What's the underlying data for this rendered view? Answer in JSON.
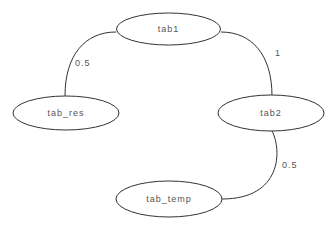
{
  "diagram": {
    "type": "graph",
    "background": "#ffffff",
    "stroke_color": "#333333",
    "text_color": "#555555",
    "nodes": [
      {
        "id": "tab1",
        "label": "tab1",
        "cx": 168.5,
        "cy": 29,
        "rx": 52,
        "ry": 16
      },
      {
        "id": "tab_res",
        "label": "tab_res",
        "cx": 66,
        "cy": 113,
        "rx": 53,
        "ry": 17
      },
      {
        "id": "tab2",
        "label": "tab2",
        "cx": 271,
        "cy": 113,
        "rx": 53,
        "ry": 18
      },
      {
        "id": "tab_temp",
        "label": "tab_temp",
        "cx": 169,
        "cy": 199,
        "rx": 53,
        "ry": 18
      }
    ],
    "edges": [
      {
        "from": "tab1",
        "to": "tab_res",
        "weight": "0.5",
        "label_x": 75,
        "label_y": 66
      },
      {
        "from": "tab1",
        "to": "tab2",
        "weight": "1",
        "label_x": 275,
        "label_y": 56
      },
      {
        "from": "tab2",
        "to": "tab_temp",
        "weight": "0.5",
        "label_x": 282,
        "label_y": 168
      }
    ]
  }
}
